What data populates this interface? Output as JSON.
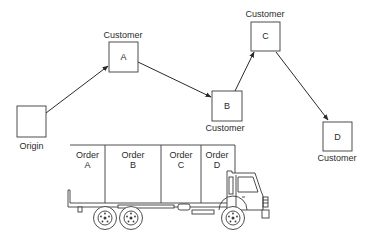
{
  "diagram": {
    "nodes": {
      "origin": {
        "label": "Origin",
        "inner": ""
      },
      "a": {
        "caption": "Customer",
        "inner": "A"
      },
      "b": {
        "caption": "Customer",
        "inner": "B"
      },
      "c": {
        "caption": "Customer",
        "inner": "C"
      },
      "d": {
        "caption": "Customer",
        "inner": "D"
      }
    },
    "route": [
      "Origin",
      "A",
      "B",
      "C",
      "D"
    ],
    "truck": {
      "compartments": [
        {
          "line1": "Order",
          "line2": "A"
        },
        {
          "line1": "Order",
          "line2": "B"
        },
        {
          "line1": "Order",
          "line2": "C"
        },
        {
          "line1": "Order",
          "line2": "D"
        }
      ]
    },
    "colors": {
      "stroke": "#2a2a2a",
      "background": "#ffffff"
    }
  }
}
